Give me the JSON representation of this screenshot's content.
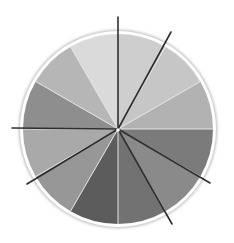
{
  "diagram": {
    "type": "sector-wheel",
    "center": [
      118,
      129
    ],
    "radius": 95,
    "rim_color": "#ffffff",
    "rim_shadow_color": "#b8b8b8",
    "sectors": [
      {
        "start_deg": 0,
        "end_deg": 30,
        "color": "#b2b2b2"
      },
      {
        "start_deg": 30,
        "end_deg": 60,
        "color": "#c6c6c6"
      },
      {
        "start_deg": 60,
        "end_deg": 90,
        "color": "#cecece"
      },
      {
        "start_deg": 90,
        "end_deg": 120,
        "color": "#dadada"
      },
      {
        "start_deg": 120,
        "end_deg": 150,
        "color": "#b6b6b6"
      },
      {
        "start_deg": 150,
        "end_deg": 180,
        "color": "#8e8e8e"
      },
      {
        "start_deg": 180,
        "end_deg": 210,
        "color": "#a9a9a9"
      },
      {
        "start_deg": 210,
        "end_deg": 240,
        "color": "#979797"
      },
      {
        "start_deg": 240,
        "end_deg": 270,
        "color": "#5c5c5c"
      },
      {
        "start_deg": 270,
        "end_deg": 300,
        "color": "#727272"
      },
      {
        "start_deg": 300,
        "end_deg": 330,
        "color": "#8a8a8a"
      },
      {
        "start_deg": 330,
        "end_deg": 360,
        "color": "#7b7b7b"
      }
    ],
    "separator_color": "#e6e6e6",
    "rays": [
      {
        "end": [
          118,
          17
        ],
        "color": "#2e2e2e"
      },
      {
        "end": [
          171,
          32
        ],
        "color": "#2e2e2e"
      },
      {
        "end": [
          12,
          128
        ],
        "color": "#2e2e2e"
      },
      {
        "end": [
          27,
          184
        ],
        "color": "#2e2e2e"
      },
      {
        "end": [
          172,
          224
        ],
        "color": "#2e2e2e"
      },
      {
        "end": [
          210,
          183
        ],
        "color": "#2e2e2e"
      }
    ],
    "center_dot_color": "#ffffff"
  }
}
